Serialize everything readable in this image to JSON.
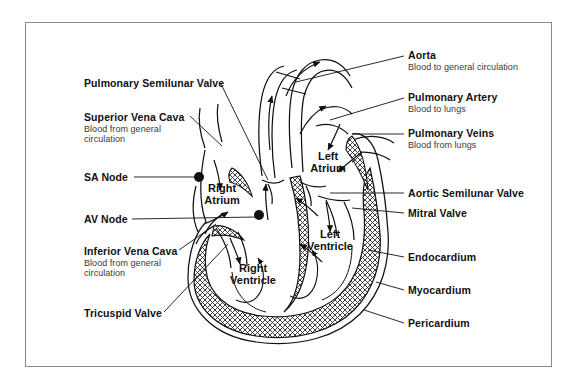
{
  "figure": {
    "type": "anatomical-diagram",
    "border_color": "#8a8a8a",
    "line_color": "#111111",
    "background": "#ffffff"
  },
  "labels_left": [
    {
      "id": "pulmonary-semilunar-valve",
      "title": "Pulmonary Semilunar Valve",
      "subtitle": "",
      "x": 84,
      "y": 78
    },
    {
      "id": "superior-vena-cava",
      "title": "Superior Vena Cava",
      "subtitle": "Blood from general\ncirculation",
      "x": 84,
      "y": 112
    },
    {
      "id": "sa-node",
      "title": "SA Node",
      "subtitle": "",
      "x": 84,
      "y": 172
    },
    {
      "id": "av-node",
      "title": "AV Node",
      "subtitle": "",
      "x": 84,
      "y": 214
    },
    {
      "id": "inferior-vena-cava",
      "title": "Inferior Vena Cava",
      "subtitle": "Blood from general\ncirculation",
      "x": 84,
      "y": 246
    },
    {
      "id": "tricuspid-valve",
      "title": "Tricuspid Valve",
      "subtitle": "",
      "x": 84,
      "y": 308
    }
  ],
  "labels_right": [
    {
      "id": "aorta",
      "title": "Aorta",
      "subtitle": "Blood to general circulation",
      "x": 408,
      "y": 50
    },
    {
      "id": "pulmonary-artery",
      "title": "Pulmonary Artery",
      "subtitle": "Blood to lungs",
      "x": 408,
      "y": 92
    },
    {
      "id": "pulmonary-veins",
      "title": "Pulmonary Veins",
      "subtitle": "Blood from lungs",
      "x": 408,
      "y": 128
    },
    {
      "id": "aortic-semilunar-valve",
      "title": "Aortic Semilunar Valve",
      "subtitle": "",
      "x": 408,
      "y": 188
    },
    {
      "id": "mitral-valve",
      "title": "Mitral Valve",
      "subtitle": "",
      "x": 408,
      "y": 208
    },
    {
      "id": "endocardium",
      "title": "Endocardium",
      "subtitle": "",
      "x": 408,
      "y": 252
    },
    {
      "id": "myocardium",
      "title": "Myocardium",
      "subtitle": "",
      "x": 408,
      "y": 285
    },
    {
      "id": "pericardium",
      "title": "Pericardium",
      "subtitle": "",
      "x": 408,
      "y": 318
    }
  ],
  "chamber_labels": [
    {
      "id": "right-atrium",
      "line1": "Right",
      "line2": "Atrium",
      "x": 222,
      "y": 182
    },
    {
      "id": "left-atrium",
      "line1": "Left",
      "line2": "Atrium",
      "x": 328,
      "y": 150
    },
    {
      "id": "right-ventricle",
      "line1": "Right",
      "line2": "Ventricle",
      "x": 253,
      "y": 262
    },
    {
      "id": "left-ventricle",
      "line1": "Left",
      "line2": "Ventricle",
      "x": 330,
      "y": 228
    }
  ],
  "nodes": [
    {
      "id": "sa-node-dot",
      "x": 199,
      "y": 177,
      "r": 5
    },
    {
      "id": "av-node-dot",
      "x": 259,
      "y": 215,
      "r": 5
    }
  ]
}
